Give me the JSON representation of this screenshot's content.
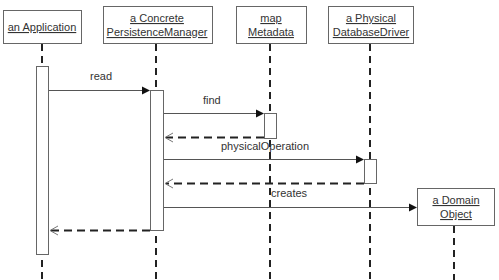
{
  "diagram": {
    "type": "sequence",
    "participants": [
      {
        "id": "app",
        "lines": [
          "an Application"
        ]
      },
      {
        "id": "pm",
        "lines": [
          "a Concrete",
          "PersistenceManager"
        ]
      },
      {
        "id": "meta",
        "lines": [
          "map",
          "Metadata"
        ]
      },
      {
        "id": "db",
        "lines": [
          "a Physical",
          "DatabaseDriver"
        ]
      },
      {
        "id": "dom",
        "lines": [
          "a Domain",
          "Object"
        ]
      }
    ],
    "messages": [
      {
        "from": "app",
        "to": "pm",
        "label": "read",
        "kind": "call"
      },
      {
        "from": "pm",
        "to": "meta",
        "label": "find",
        "kind": "call"
      },
      {
        "from": "meta",
        "to": "pm",
        "label": "",
        "kind": "return"
      },
      {
        "from": "pm",
        "to": "db",
        "label": "physicalOperation",
        "kind": "call"
      },
      {
        "from": "db",
        "to": "pm",
        "label": "",
        "kind": "return"
      },
      {
        "from": "pm",
        "to": "dom",
        "label": "creates",
        "kind": "create"
      },
      {
        "from": "pm",
        "to": "app",
        "label": "",
        "kind": "return"
      }
    ]
  }
}
